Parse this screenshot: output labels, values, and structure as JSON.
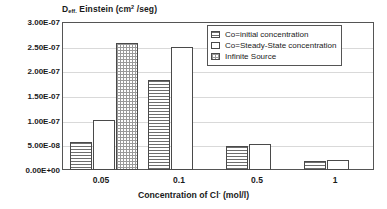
{
  "chart_data": {
    "type": "bar",
    "title": "",
    "ylabel_parts": {
      "main": "D",
      "sub": "eff.",
      "rest": " Einstein (cm",
      "sup": "2",
      "tail": " /seg)"
    },
    "ylabel": "Deff. Einstein (cm2 /seg)",
    "xlabel_parts": {
      "main": "Concentration of Cl",
      "sup": "-",
      "tail": "  (mol/l)"
    },
    "xlabel": "Concentration of Cl- (mol/l)",
    "categories": [
      "0.05",
      "0.1",
      "0.5",
      "1"
    ],
    "series": [
      {
        "name": "Co=initial concentration",
        "pattern": "horizontal-hatch",
        "values": [
          5.7e-08,
          1.83e-07,
          4.9e-08,
          1.8e-08
        ]
      },
      {
        "name": "Co=Steady-State concentration",
        "pattern": "plain-white",
        "values": [
          1.02e-07,
          2.5e-07,
          5.2e-08,
          2e-08
        ]
      },
      {
        "name": "Infinite Source",
        "pattern": "dotted",
        "values": [
          2.57e-07,
          null,
          null,
          null
        ]
      }
    ],
    "ylim": [
      0,
      3e-07
    ],
    "ytick_labels": [
      "3.00E-07",
      "2.50E-07",
      "2.00E-07",
      "1.50E-07",
      "1.00E-07",
      "5.00E-08",
      "0.00E+00"
    ],
    "ytick_values": [
      3e-07,
      2.5e-07,
      2e-07,
      1.5e-07,
      1e-07,
      5e-08,
      0
    ],
    "grid": true,
    "legend_position": "top-right-inside",
    "colors": {
      "bar_edge": "#4a4a4a",
      "hatch": "#6e6e6e",
      "dots": "#9a9a9a",
      "grid": "#d9d9d9",
      "frame": "#555555",
      "background": "#ffffff"
    }
  },
  "legend": {
    "entries": [
      {
        "label": "Co=initial concentration",
        "pattern": "horizontal-hatch"
      },
      {
        "label": "Co=Steady-State concentration",
        "pattern": "plain-white"
      },
      {
        "label": "Infinite Source",
        "pattern": "dotted"
      }
    ]
  }
}
